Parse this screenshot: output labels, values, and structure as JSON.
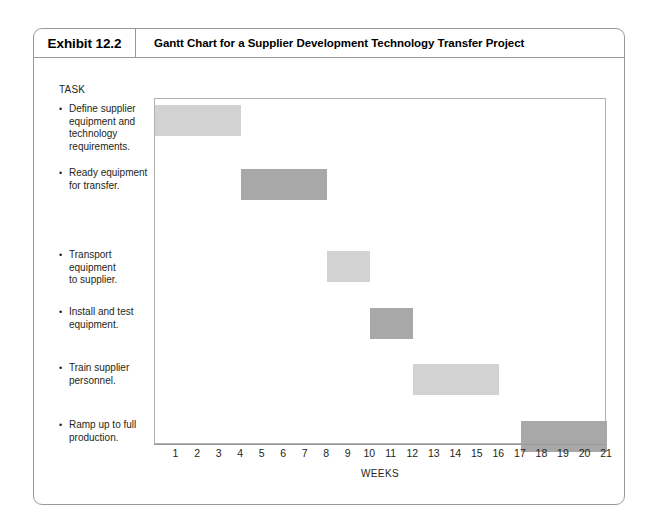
{
  "exhibit": {
    "number": "Exhibit 12.2",
    "title": "Gantt Chart for a Supplier Development Technology Transfer Project"
  },
  "chart_data": {
    "type": "bar",
    "orientation": "horizontal",
    "subtype": "gantt",
    "title": "Gantt Chart for a Supplier Development Technology Transfer Project",
    "xlabel": "WEEKS",
    "ylabel": "TASK",
    "xlim": [
      0,
      21
    ],
    "xticks": [
      1,
      2,
      3,
      4,
      5,
      6,
      7,
      8,
      9,
      10,
      11,
      12,
      13,
      14,
      15,
      16,
      17,
      18,
      19,
      20,
      21
    ],
    "xticklabels": [
      "1",
      "2",
      "3",
      "4",
      "5",
      "6",
      "7",
      "8",
      "9",
      "10",
      "11",
      "12",
      "13",
      "14",
      "15",
      "16",
      "17",
      "18",
      "19",
      "20",
      "21"
    ],
    "grid": false,
    "legend": false,
    "bar_colors": {
      "light": "#d2d2d2",
      "dark": "#a8a8a8"
    },
    "categories": [
      "Define supplier equipment and technology requirements.",
      "Ready equipment for transfer.",
      "Transport equipment to supplier.",
      "Install and test equipment.",
      "Train supplier personnel.",
      "Ramp up to full production."
    ],
    "tasks": [
      {
        "label": "Define supplier equipment and technology requirements.",
        "start": 0,
        "end": 4,
        "duration": 4,
        "shade": "light"
      },
      {
        "label": "Ready equipment for transfer.",
        "start": 4,
        "end": 8,
        "duration": 4,
        "shade": "dark"
      },
      {
        "label": "Transport equipment to supplier.",
        "start": 8,
        "end": 10,
        "duration": 2,
        "shade": "light"
      },
      {
        "label": "Install and test equipment.",
        "start": 10,
        "end": 12,
        "duration": 2,
        "shade": "dark"
      },
      {
        "label": "Train supplier personnel.",
        "start": 12,
        "end": 16,
        "duration": 4,
        "shade": "light"
      },
      {
        "label": "Ramp up to full production.",
        "start": 17,
        "end": 21,
        "duration": 4,
        "shade": "dark"
      }
    ]
  },
  "task_labels": [
    {
      "bullet": "•",
      "lines": [
        "Define supplier",
        "equipment and",
        "technology",
        "requirements."
      ]
    },
    {
      "bullet": "•",
      "lines": [
        "Ready equipment",
        "for transfer."
      ]
    },
    {
      "bullet": "•",
      "lines": [
        "Transport",
        "equipment",
        "to supplier."
      ]
    },
    {
      "bullet": "•",
      "lines": [
        "Install and test",
        "equipment."
      ]
    },
    {
      "bullet": "•",
      "lines": [
        "Train supplier",
        "personnel."
      ]
    },
    {
      "bullet": "•",
      "lines": [
        "Ramp up to full",
        "production."
      ]
    }
  ],
  "axis": {
    "task_header": "TASK",
    "weeks_label": "WEEKS"
  }
}
